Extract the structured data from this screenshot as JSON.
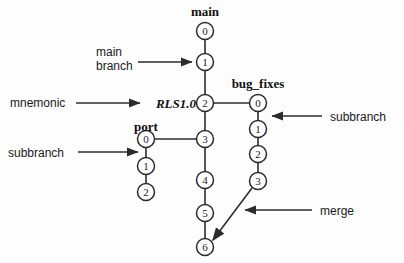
{
  "diagram": {
    "type": "version-control-branch-tree",
    "background_color": "#fdfdfd",
    "line_color": "#2b2b2b",
    "node_fill": "#ffffff"
  },
  "branches": [
    {
      "id": "main",
      "name": "main",
      "name_style": "bold-serif",
      "name_x": 205,
      "name_y": 16,
      "orientation": "vertical",
      "x": 205,
      "nodes": [
        {
          "label": "0",
          "x": 205,
          "y": 31
        },
        {
          "label": "1",
          "x": 205,
          "y": 62
        },
        {
          "label": "2",
          "x": 205,
          "y": 103
        },
        {
          "label": "3",
          "x": 205,
          "y": 139
        },
        {
          "label": "4",
          "x": 205,
          "y": 180
        },
        {
          "label": "5",
          "x": 205,
          "y": 213
        },
        {
          "label": "6",
          "x": 205,
          "y": 247
        }
      ]
    },
    {
      "id": "bug_fixes",
      "name": "bug_fixes",
      "name_style": "bold-serif",
      "name_x": 258,
      "name_y": 88,
      "orientation": "vertical",
      "x": 258,
      "nodes": [
        {
          "label": "0",
          "x": 258,
          "y": 103
        },
        {
          "label": "1",
          "x": 258,
          "y": 129
        },
        {
          "label": "2",
          "x": 258,
          "y": 154
        },
        {
          "label": "3",
          "x": 258,
          "y": 181
        }
      ]
    },
    {
      "id": "port",
      "name": "port",
      "name_style": "bold-serif",
      "name_x": 146,
      "name_y": 131,
      "orientation": "vertical",
      "x": 146,
      "nodes": [
        {
          "label": "0",
          "x": 146,
          "y": 139
        },
        {
          "label": "1",
          "x": 146,
          "y": 166
        },
        {
          "label": "2",
          "x": 146,
          "y": 192
        }
      ]
    }
  ],
  "mnemonic": {
    "text": "RLS1.0",
    "attached_to": "main node 2",
    "x": 195,
    "y": 108
  },
  "connections": [
    {
      "id": "main-to-bug_fixes",
      "from": "main.2",
      "to": "bug_fixes.0",
      "kind": "horizontal"
    },
    {
      "id": "port-to-main",
      "from": "port.0",
      "to": "main.3",
      "kind": "horizontal"
    },
    {
      "id": "merge-to-main",
      "from": "bug_fixes.3",
      "to": "main.6",
      "kind": "merge-arrow"
    }
  ],
  "annotations": [
    {
      "id": "main-branch",
      "text": "main branch",
      "lines": [
        "main",
        "branch"
      ],
      "text_x": 96,
      "text_y": 56,
      "arrow_from_x": 138,
      "arrow_from_y": 62,
      "arrow_to_x": 194,
      "arrow_to_y": 62,
      "direction": "right"
    },
    {
      "id": "mnemonic",
      "text": "mnemonic",
      "lines": [
        "mnemonic"
      ],
      "text_x": 10,
      "text_y": 107,
      "arrow_from_x": 76,
      "arrow_from_y": 103,
      "arrow_to_x": 140,
      "arrow_to_y": 103,
      "direction": "right"
    },
    {
      "id": "subbranch-left",
      "text": "subbranch",
      "lines": [
        "subbranch"
      ],
      "text_x": 8,
      "text_y": 157,
      "arrow_from_x": 78,
      "arrow_from_y": 152,
      "arrow_to_x": 139,
      "arrow_to_y": 152,
      "direction": "right"
    },
    {
      "id": "subbranch-right",
      "text": "subbranch",
      "lines": [
        "subbranch"
      ],
      "text_x": 330,
      "text_y": 121,
      "arrow_from_x": 322,
      "arrow_from_y": 116,
      "arrow_to_x": 270,
      "arrow_to_y": 116,
      "direction": "left"
    },
    {
      "id": "merge",
      "text": "merge",
      "lines": [
        "merge"
      ],
      "text_x": 320,
      "text_y": 215,
      "arrow_from_x": 312,
      "arrow_from_y": 210,
      "arrow_to_x": 243,
      "arrow_to_y": 210,
      "direction": "left"
    }
  ]
}
